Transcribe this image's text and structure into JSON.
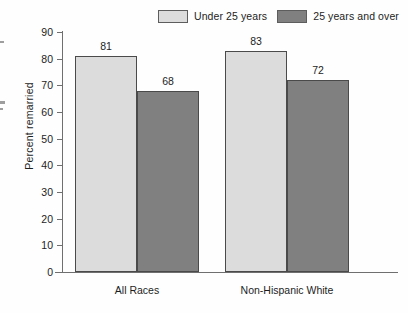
{
  "legend": {
    "entries": [
      {
        "label": "Under 25 years",
        "color": "#dcdcdc",
        "swatch_name": "legend-swatch-under-25"
      },
      {
        "label": "25 years and over",
        "color": "#808080",
        "swatch_name": "legend-swatch-25-and-over"
      }
    ]
  },
  "axis": {
    "y_title": "Percent remarried",
    "y_ticks": [
      "90",
      "80",
      "70",
      "60",
      "50",
      "40",
      "30",
      "20",
      "10",
      "0"
    ]
  },
  "chart_data": {
    "type": "bar",
    "title": "",
    "subtitle": "",
    "xlabel": "",
    "ylabel": "Percent remarried",
    "ylim": [
      0,
      90
    ],
    "ytick_step": 10,
    "grid": false,
    "legend_position": "top-right",
    "categories": [
      "All Races",
      "Non-Hispanic White"
    ],
    "series": [
      {
        "name": "Under 25 years",
        "color": "#dcdcdc",
        "values": [
          81,
          83
        ]
      },
      {
        "name": "25 years and over",
        "color": "#808080",
        "values": [
          68,
          72
        ]
      }
    ],
    "data_labels": [
      {
        "category": "All Races",
        "series": "Under 25 years",
        "value": "81"
      },
      {
        "category": "All Races",
        "series": "25 years and over",
        "value": "68"
      },
      {
        "category": "Non-Hispanic White",
        "series": "Under 25 years",
        "value": "83"
      },
      {
        "category": "Non-Hispanic White",
        "series": "25 years and over",
        "value": "72"
      }
    ]
  }
}
